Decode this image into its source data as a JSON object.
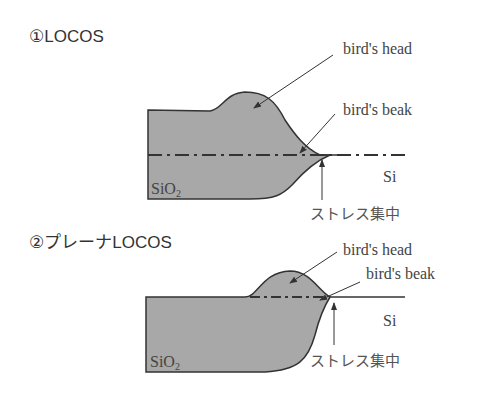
{
  "diagrams": [
    {
      "title": "①LOCOS",
      "labels": {
        "head": "bird's head",
        "beak": "bird's beak",
        "si": "Si",
        "oxide": "SiO",
        "oxide_sub": "2",
        "stress": "ストレス集中"
      }
    },
    {
      "title": "②プレーナLOCOS",
      "labels": {
        "head": "bird's head",
        "beak": "bird's beak",
        "si": "Si",
        "oxide": "SiO",
        "oxide_sub": "2",
        "stress": "ストレス集中"
      }
    }
  ],
  "colors": {
    "oxide_fill": "#a8a8a8",
    "outline": "#333333"
  }
}
